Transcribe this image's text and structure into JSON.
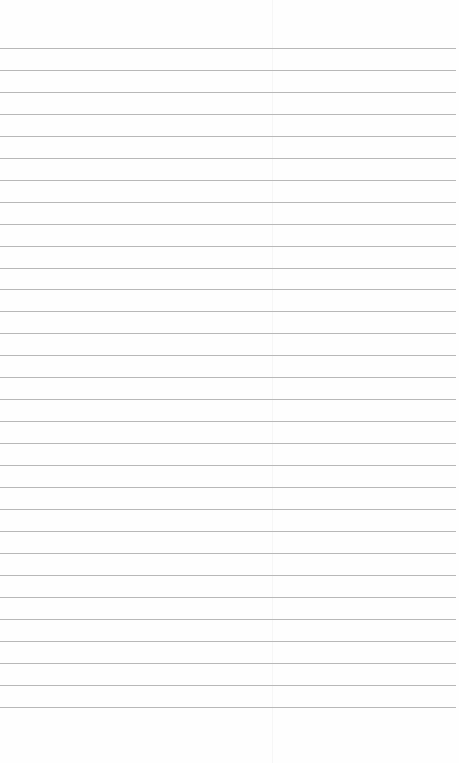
{
  "paper": {
    "type": "lined-notebook-paper",
    "line_count": 31,
    "first_line_y": 48,
    "line_spacing": 21.95,
    "line_color": "#b8b8b8",
    "background_color": "#fefefe"
  }
}
